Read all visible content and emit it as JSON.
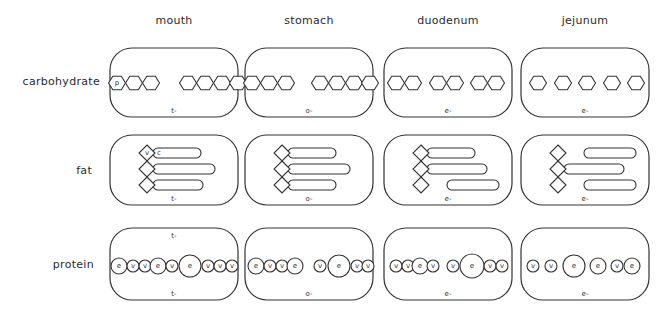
{
  "columns": [
    "mouth",
    "stomach",
    "duodenum",
    "jejunum"
  ],
  "rows": [
    "carbohydrate",
    "fat",
    "protein"
  ],
  "layout": {
    "col_x": [
      110,
      245,
      384,
      521
    ],
    "box_w": 128,
    "row_y": [
      48,
      135,
      228
    ],
    "row_h": [
      69,
      70,
      72
    ],
    "radius": 22
  },
  "carbohydrate": {
    "cells": [
      {
        "charge": "t-",
        "hexagons": [
          117,
          134,
          151,
          188,
          205,
          222,
          238
        ],
        "labels": {
          "0": "p"
        }
      },
      {
        "charge": "o-",
        "hexagons": [
          252,
          269,
          286,
          320,
          337,
          354,
          370
        ],
        "labels": {}
      },
      {
        "charge": "e-",
        "hexagons": [
          396,
          413,
          438,
          455,
          479,
          496
        ],
        "labels": {}
      },
      {
        "charge": "e-",
        "hexagons": [
          538,
          563,
          587,
          612,
          636
        ],
        "labels": {}
      }
    ]
  },
  "fat": {
    "cells": [
      {
        "charge": "t-",
        "diamond_x": 147,
        "diamond_labels": {
          "0": "v"
        },
        "chains": [
          {
            "x": 153,
            "y": 0,
            "w": 48,
            "label": "c"
          },
          {
            "x": 153,
            "y": 1,
            "w": 62
          },
          {
            "x": 153,
            "y": 2,
            "w": 50
          }
        ]
      },
      {
        "charge": "o-",
        "diamond_x": 282,
        "chains": [
          {
            "x": 288,
            "y": 0,
            "w": 48
          },
          {
            "x": 288,
            "y": 1,
            "w": 62
          },
          {
            "x": 288,
            "y": 2,
            "w": 48
          }
        ]
      },
      {
        "charge": "e-",
        "diamond_x": 421,
        "chains": [
          {
            "x": 427,
            "y": 0,
            "w": 48
          },
          {
            "x": 427,
            "y": 1,
            "w": 60
          },
          {
            "x": 447,
            "y": 2,
            "w": 52
          }
        ]
      },
      {
        "charge": "e-",
        "diamond_x": 558,
        "chains": [
          {
            "x": 584,
            "y": 0,
            "w": 52
          },
          {
            "x": 564,
            "y": 1,
            "w": 60
          },
          {
            "x": 584,
            "y": 2,
            "w": 52
          }
        ]
      }
    ]
  },
  "protein": {
    "cells": [
      {
        "charge_top": "t-",
        "charge": "t-",
        "circles": [
          {
            "x": 119,
            "r": 8,
            "l": "e"
          },
          {
            "x": 133,
            "r": 6,
            "l": "v"
          },
          {
            "x": 145,
            "r": 6,
            "l": "v"
          },
          {
            "x": 158,
            "r": 8,
            "l": "e"
          },
          {
            "x": 172,
            "r": 6,
            "l": "v"
          },
          {
            "x": 190,
            "r": 11,
            "l": "e"
          },
          {
            "x": 208,
            "r": 6,
            "l": "v"
          },
          {
            "x": 220,
            "r": 6,
            "l": "v"
          },
          {
            "x": 232,
            "r": 6,
            "l": "v"
          }
        ]
      },
      {
        "charge": "o-",
        "circles": [
          {
            "x": 256,
            "r": 8,
            "l": "e"
          },
          {
            "x": 270,
            "r": 6,
            "l": "v"
          },
          {
            "x": 282,
            "r": 6,
            "l": "v"
          },
          {
            "x": 295,
            "r": 8,
            "l": "e"
          },
          {
            "x": 320,
            "r": 6,
            "l": "v"
          },
          {
            "x": 339,
            "r": 11,
            "l": "e"
          },
          {
            "x": 357,
            "r": 6,
            "l": "v"
          },
          {
            "x": 368,
            "r": 6,
            "l": "v"
          }
        ]
      },
      {
        "charge": "e-",
        "circles": [
          {
            "x": 396,
            "r": 6,
            "l": "v"
          },
          {
            "x": 408,
            "r": 6,
            "l": "v"
          },
          {
            "x": 420,
            "r": 8,
            "l": "e"
          },
          {
            "x": 433,
            "r": 6,
            "l": "v"
          },
          {
            "x": 453,
            "r": 6,
            "l": "v"
          },
          {
            "x": 472,
            "r": 12,
            "l": "e"
          },
          {
            "x": 490,
            "r": 6,
            "l": "v"
          },
          {
            "x": 502,
            "r": 6,
            "l": "v"
          }
        ]
      },
      {
        "charge": "e-",
        "circles": [
          {
            "x": 533,
            "r": 6,
            "l": "v"
          },
          {
            "x": 551,
            "r": 6,
            "l": "v"
          },
          {
            "x": 574,
            "r": 11,
            "l": "e"
          },
          {
            "x": 598,
            "r": 8,
            "l": "e"
          },
          {
            "x": 617,
            "r": 6,
            "l": "v"
          },
          {
            "x": 632,
            "r": 8,
            "l": "e"
          }
        ]
      }
    ]
  }
}
